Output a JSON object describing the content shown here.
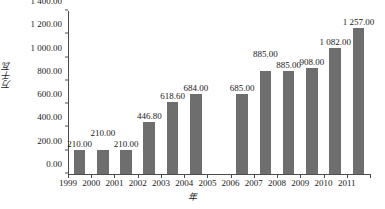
{
  "chart_data": {
    "type": "bar",
    "title": "",
    "xlabel": "年",
    "ylabel": "万千瓦",
    "categories": [
      "1999",
      "2000",
      "2001",
      "2002",
      "2003",
      "2004",
      "2005",
      "2006",
      "2007",
      "2008",
      "2009",
      "2010",
      "2011"
    ],
    "values": [
      210.0,
      210.0,
      210.0,
      446.8,
      618.6,
      684.0,
      null,
      685.0,
      885.0,
      885.0,
      908.0,
      1082.0,
      1257.0
    ],
    "data_labels": [
      "210.00",
      "210.00",
      "210.00",
      "446.80",
      "618.60",
      "684.00",
      "",
      "685.00",
      "885.00",
      "885.00",
      "908.00",
      "1 082.00",
      "1 257.00"
    ],
    "label_raised": [
      false,
      true,
      false,
      false,
      false,
      false,
      false,
      false,
      true,
      false,
      false,
      false,
      false
    ],
    "ylim": [
      0,
      1400
    ],
    "yticks": [
      0,
      200,
      400,
      600,
      800,
      1000,
      1200,
      1400
    ],
    "ytick_labels": [
      "0.00",
      "200.00",
      "400.00",
      "600.00",
      "800.00",
      "1 000.00",
      "1 200.00",
      "1 400.00"
    ],
    "xtick_labels": [
      "1999",
      "2000",
      "2001",
      "2002",
      "2003",
      "2004",
      "2005",
      "2006",
      "2007",
      "2008",
      "2009",
      "2010",
      "2011"
    ],
    "grid": false,
    "legend": false,
    "bar_color": "#6e6e6e",
    "axis_color": "#4d4d4d",
    "text_color": "#1a1a1a",
    "background": "#ffffff"
  }
}
